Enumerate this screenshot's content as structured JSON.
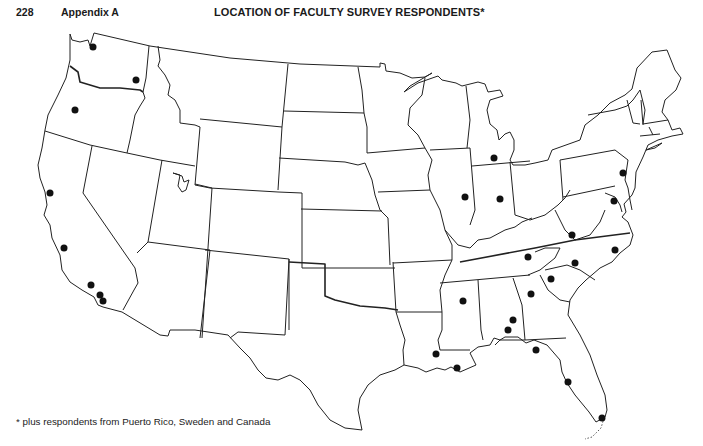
{
  "header": {
    "page_number": "228",
    "section": "Appendix A",
    "title": "LOCATION OF FACULTY SURVEY RESPONDENTS*"
  },
  "footnote": "* plus respondents from Puerto Rico, Sweden and Canada",
  "map": {
    "type": "outline map of contiguous United States with state borders",
    "marker_color": "#111111",
    "markers": [
      {
        "state": "Washington",
        "x": 93,
        "y": 47
      },
      {
        "state": "Washington",
        "x": 136,
        "y": 80
      },
      {
        "state": "Oregon",
        "x": 75,
        "y": 110
      },
      {
        "state": "California",
        "x": 50,
        "y": 193
      },
      {
        "state": "California",
        "x": 64,
        "y": 248
      },
      {
        "state": "California",
        "x": 91,
        "y": 285
      },
      {
        "state": "California",
        "x": 100,
        "y": 295
      },
      {
        "state": "California",
        "x": 103,
        "y": 301
      },
      {
        "state": "Michigan",
        "x": 494,
        "y": 158
      },
      {
        "state": "Illinois",
        "x": 465,
        "y": 197
      },
      {
        "state": "Indiana",
        "x": 500,
        "y": 199
      },
      {
        "state": "Pennsylvania",
        "x": 623,
        "y": 173
      },
      {
        "state": "Maryland",
        "x": 614,
        "y": 201
      },
      {
        "state": "Virginia",
        "x": 572,
        "y": 235
      },
      {
        "state": "North Carolina",
        "x": 615,
        "y": 250
      },
      {
        "state": "Tennessee",
        "x": 528,
        "y": 257
      },
      {
        "state": "North Carolina",
        "x": 575,
        "y": 263
      },
      {
        "state": "South Carolina",
        "x": 551,
        "y": 279
      },
      {
        "state": "Georgia",
        "x": 531,
        "y": 294
      },
      {
        "state": "Mississippi",
        "x": 463,
        "y": 301
      },
      {
        "state": "Alabama",
        "x": 513,
        "y": 320
      },
      {
        "state": "Alabama",
        "x": 508,
        "y": 330
      },
      {
        "state": "Louisiana",
        "x": 436,
        "y": 354
      },
      {
        "state": "Louisiana",
        "x": 457,
        "y": 368
      },
      {
        "state": "Florida",
        "x": 536,
        "y": 350
      },
      {
        "state": "Florida",
        "x": 568,
        "y": 382
      },
      {
        "state": "Florida",
        "x": 602,
        "y": 418
      }
    ]
  }
}
